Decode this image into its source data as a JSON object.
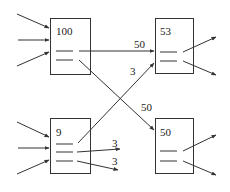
{
  "diagram": {
    "colors": {
      "stroke": "#333333",
      "text": "#222222",
      "background": "#ffffff"
    },
    "nodes": [
      {
        "id": "n100",
        "value": "100"
      },
      {
        "id": "n53",
        "value": "53"
      },
      {
        "id": "n9",
        "value": "9"
      },
      {
        "id": "n50",
        "value": "50"
      }
    ],
    "edges": [
      {
        "from": "n100",
        "to": "n53",
        "label": "50"
      },
      {
        "from": "n100",
        "to": "n50",
        "label": "50"
      },
      {
        "from": "n9",
        "to": "n53",
        "label": "3"
      },
      {
        "from": "n9",
        "to": "out-1",
        "label": "3"
      },
      {
        "from": "n9",
        "to": "out-2",
        "label": "3"
      }
    ]
  }
}
